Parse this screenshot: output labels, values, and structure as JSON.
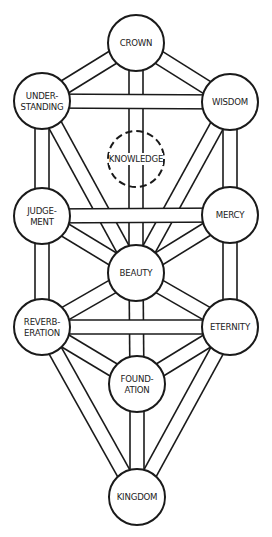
{
  "diagram": {
    "colors": {
      "stroke": "#1a1a1a",
      "fill": "#ffffff",
      "text": "#222222"
    },
    "path_width": 14,
    "node_radius": 28,
    "nodes": [
      {
        "id": "crown",
        "label_lines": [
          "CROWN"
        ],
        "cx": 136,
        "cy": 43,
        "dashed": false
      },
      {
        "id": "understanding",
        "label_lines": [
          "UNDER-",
          "STANDING"
        ],
        "cx": 42,
        "cy": 101,
        "dashed": false
      },
      {
        "id": "wisdom",
        "label_lines": [
          "WISDOM"
        ],
        "cx": 230,
        "cy": 102,
        "dashed": false
      },
      {
        "id": "knowledge",
        "label_lines": [
          "KNOWLEDGE"
        ],
        "cx": 136,
        "cy": 159,
        "dashed": true
      },
      {
        "id": "judgement",
        "label_lines": [
          "JUDGE-",
          "MENT"
        ],
        "cx": 42,
        "cy": 216,
        "dashed": false
      },
      {
        "id": "mercy",
        "label_lines": [
          "MERCY"
        ],
        "cx": 230,
        "cy": 215,
        "dashed": false
      },
      {
        "id": "beauty",
        "label_lines": [
          "BEAUTY"
        ],
        "cx": 136,
        "cy": 273,
        "dashed": false
      },
      {
        "id": "reverberation",
        "label_lines": [
          "REVERB-",
          "ERATION"
        ],
        "cx": 42,
        "cy": 327,
        "dashed": false
      },
      {
        "id": "eternity",
        "label_lines": [
          "ETERNITY"
        ],
        "cx": 230,
        "cy": 327,
        "dashed": false
      },
      {
        "id": "foundation",
        "label_lines": [
          "FOUND-",
          "ATION"
        ],
        "cx": 137,
        "cy": 384,
        "dashed": false
      },
      {
        "id": "kingdom",
        "label_lines": [
          "KINGDOM"
        ],
        "cx": 137,
        "cy": 497,
        "dashed": false
      }
    ],
    "paths": [
      {
        "from": "crown",
        "to": "beauty",
        "layer": 0
      },
      {
        "from": "understanding",
        "to": "beauty",
        "layer": 0
      },
      {
        "from": "wisdom",
        "to": "beauty",
        "layer": 0
      },
      {
        "from": "beauty",
        "to": "foundation",
        "layer": 0
      },
      {
        "from": "reverberation",
        "to": "kingdom",
        "layer": 0
      },
      {
        "from": "eternity",
        "to": "kingdom",
        "layer": 0
      },
      {
        "from": "foundation",
        "to": "kingdom",
        "layer": 0
      },
      {
        "from": "crown",
        "to": "understanding",
        "layer": 1
      },
      {
        "from": "crown",
        "to": "wisdom",
        "layer": 1
      },
      {
        "from": "understanding",
        "to": "judgement",
        "layer": 1
      },
      {
        "from": "wisdom",
        "to": "mercy",
        "layer": 1
      },
      {
        "from": "judgement",
        "to": "beauty",
        "layer": 1
      },
      {
        "from": "mercy",
        "to": "beauty",
        "layer": 1
      },
      {
        "from": "judgement",
        "to": "reverberation",
        "layer": 1
      },
      {
        "from": "mercy",
        "to": "eternity",
        "layer": 1
      },
      {
        "from": "beauty",
        "to": "reverberation",
        "layer": 1
      },
      {
        "from": "beauty",
        "to": "eternity",
        "layer": 1
      },
      {
        "from": "reverberation",
        "to": "foundation",
        "layer": 1
      },
      {
        "from": "eternity",
        "to": "foundation",
        "layer": 1
      },
      {
        "from": "understanding",
        "to": "wisdom",
        "layer": 2
      },
      {
        "from": "judgement",
        "to": "mercy",
        "layer": 2
      },
      {
        "from": "reverberation",
        "to": "eternity",
        "layer": 2
      }
    ]
  }
}
